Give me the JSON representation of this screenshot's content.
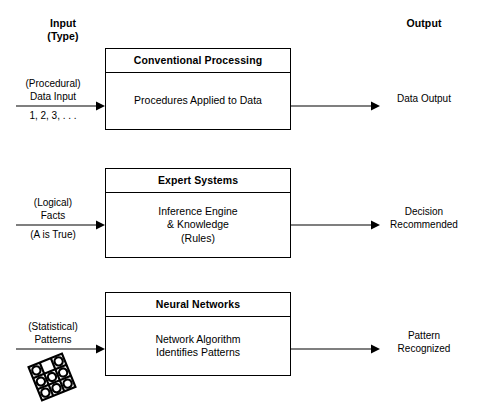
{
  "headers": {
    "input": "Input\n(Type)",
    "output": "Output"
  },
  "rows": [
    {
      "box_title": "Conventional Processing",
      "box_body": "Procedures Applied to Data",
      "input_top": "(Procedural)\nData Input",
      "input_bottom": "1, 2, 3, . . .",
      "output": "Data Output",
      "input_icon": "",
      "arrow_in_icon": "arrow-right-icon",
      "arrow_out_icon": "arrow-right-icon"
    },
    {
      "box_title": "Expert Systems",
      "box_body": "Inference Engine\n& Knowledge\n(Rules)",
      "input_top": "(Logical)\nFacts",
      "input_bottom": "(A is True)",
      "output": "Decision\nRecommended",
      "input_icon": "",
      "arrow_in_icon": "arrow-right-icon",
      "arrow_out_icon": "arrow-right-icon"
    },
    {
      "box_title": "Neural Networks",
      "box_body": "Network Algorithm\nIdentifies Patterns",
      "input_top": "(Statistical)\nPatterns",
      "input_bottom": "",
      "output": "Pattern\nRecognized",
      "input_icon": "rotated-grid-pattern-icon",
      "arrow_in_icon": "arrow-right-icon",
      "arrow_out_icon": "arrow-right-icon"
    }
  ],
  "colors": {
    "stroke": "#000000",
    "background": "#ffffff",
    "text": "#000000"
  },
  "pattern_icon": {
    "rotation_degrees": -22,
    "grid_rows": 3,
    "grid_cols": 3,
    "filled_cells": [
      [
        true,
        false,
        true
      ],
      [
        true,
        true,
        true
      ],
      [
        true,
        true,
        true
      ]
    ]
  }
}
